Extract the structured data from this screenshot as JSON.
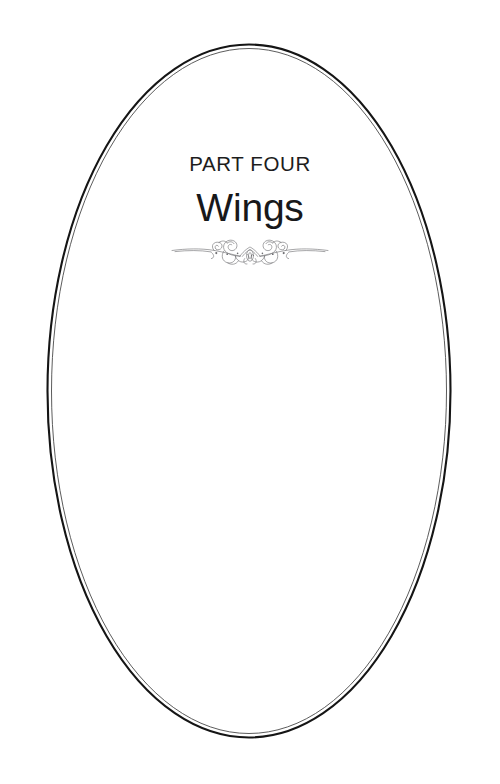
{
  "page": {
    "background_color": "#ffffff",
    "width": 500,
    "height": 784
  },
  "frame": {
    "shape": "ellipse",
    "stroke_color": "#151515",
    "secondary_stroke_color": "#3a3a3a",
    "center_x": 249,
    "center_y": 391,
    "radius_x": 202,
    "radius_y": 347
  },
  "content": {
    "part_label": "PART FOUR",
    "part_title": "Wings",
    "ornament_name": "flourish-divider-ornament",
    "ornament_color": "#6e6e72",
    "text_color": "#1d1d1d",
    "title_color": "#18181a"
  }
}
